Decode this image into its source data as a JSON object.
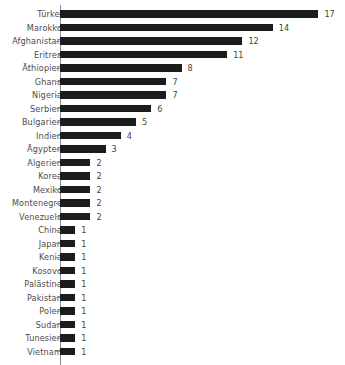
{
  "chart_data": {
    "type": "bar",
    "orientation": "horizontal",
    "title": "",
    "subtitle": "",
    "xlabel": "",
    "ylabel": "",
    "xlim": [
      0,
      17
    ],
    "grid": false,
    "legend": null,
    "bar_color": "#1c1c1c",
    "axis_color": "#8d8d8d",
    "background_color": "#ffffff",
    "show_value_labels": true,
    "categories": [
      "Türkei",
      "Marokko",
      "Afghanistan",
      "Eritrea",
      "Äthiopien",
      "Ghana",
      "Nigeria",
      "Serbien",
      "Bulgarien",
      "Indien",
      "Ägypten",
      "Algerien",
      "Korea",
      "Mexiko",
      "Montenegro",
      "Venezuela",
      "China",
      "Japan",
      "Kenia",
      "Kosovo",
      "Palästina",
      "Pakistan",
      "Polen",
      "Sudan",
      "Tunesien",
      "Vietnam"
    ],
    "values": [
      17,
      14,
      12,
      11,
      8,
      7,
      7,
      6,
      5,
      4,
      3,
      2,
      2,
      2,
      2,
      2,
      1,
      1,
      1,
      1,
      1,
      1,
      1,
      1,
      1,
      1
    ]
  }
}
